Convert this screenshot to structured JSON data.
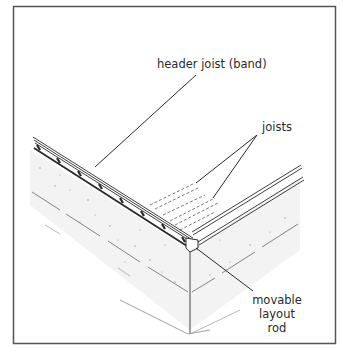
{
  "figure": {
    "labels": {
      "header_joist": "header joist (band)",
      "joists": "joists",
      "layout_rod": [
        "movable",
        "layout",
        "rod"
      ]
    },
    "colors": {
      "line": "#2a2a2a",
      "frame": "#555555",
      "stipple": "#b0b0b0",
      "background": "#ffffff"
    }
  }
}
